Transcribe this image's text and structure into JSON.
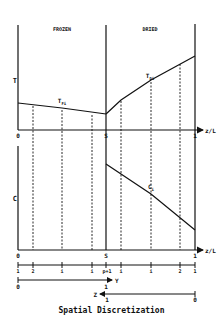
{
  "figure": {
    "caption": "Spatial Discretization",
    "regions": {
      "frozen": "FROZEN",
      "dried": "DRIED"
    },
    "top_plot": {
      "y_axis_label": "T",
      "x_axis_label": "z/L",
      "origin_label": "0",
      "interface_label": "S",
      "end_label": "1",
      "curves": {
        "frozen": "T_Fi",
        "dried": "T_Di"
      }
    },
    "bottom_plot": {
      "y_axis_label": "C",
      "x_axis_label": "z/L",
      "origin_label": "0",
      "interface_label": "S",
      "end_label": "1",
      "curves": {
        "dried": "C_i"
      }
    },
    "node_row": {
      "frozen_labels": [
        "1",
        "2",
        "i",
        "i",
        "p+1"
      ],
      "dried_labels": [
        "i",
        "i",
        "2",
        "1"
      ]
    },
    "y_coordinate": {
      "label": "Y",
      "start": "0",
      "end": "1"
    },
    "z_coordinate": {
      "label": "Z",
      "start": "1",
      "end": "0"
    },
    "colors": {
      "ink": "#111111",
      "background": "#ffffff"
    }
  }
}
